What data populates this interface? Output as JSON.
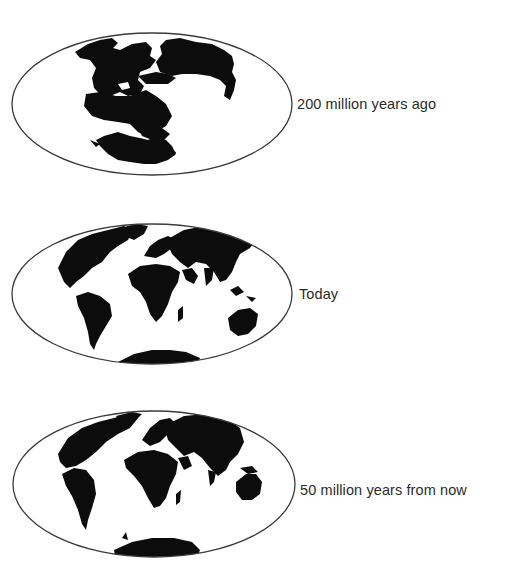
{
  "figure": {
    "panels": [
      {
        "id": "past",
        "label": "200 million years ago",
        "description": "Pangaea supercontinent"
      },
      {
        "id": "present",
        "label": "Today",
        "description": "Present-day continents"
      },
      {
        "id": "future",
        "label": "50 million years from now",
        "description": "Projected continent positions"
      }
    ]
  },
  "colors": {
    "land": "#0c0c0c",
    "ocean": "#ffffff",
    "outline": "#3a3a3a",
    "text": "#2b2b2b"
  }
}
